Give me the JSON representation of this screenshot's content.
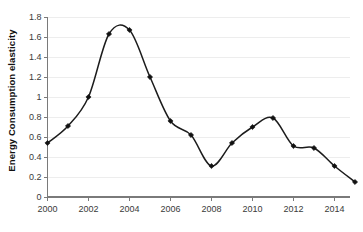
{
  "chart_data": {
    "type": "line",
    "title": "",
    "xlabel": "",
    "ylabel": "Energy Consumption elasticity",
    "x": [
      2000,
      2001,
      2002,
      2003,
      2004,
      2005,
      2006,
      2007,
      2008,
      2009,
      2010,
      2011,
      2012,
      2013,
      2014,
      2015
    ],
    "values": [
      0.54,
      0.71,
      1.0,
      1.63,
      1.67,
      1.2,
      0.76,
      0.62,
      0.31,
      0.54,
      0.7,
      0.79,
      0.51,
      0.49,
      0.31,
      0.15
    ],
    "series": [
      {
        "name": "Energy Consumption elasticity",
        "values": [
          0.54,
          0.71,
          1.0,
          1.63,
          1.67,
          1.2,
          0.76,
          0.62,
          0.31,
          0.54,
          0.7,
          0.79,
          0.51,
          0.49,
          0.31,
          0.15
        ]
      }
    ],
    "xlim": [
      2000,
      2015
    ],
    "ylim": [
      0,
      1.8
    ],
    "ytick_labels": [
      "0",
      "0.2",
      "0.4",
      "0.6",
      "0.8",
      "1",
      "1.2",
      "1.4",
      "1.6",
      "1.8"
    ],
    "ytick_values": [
      0,
      0.2,
      0.4,
      0.6,
      0.8,
      1.0,
      1.2,
      1.4,
      1.6,
      1.8
    ],
    "xtick_labels": [
      "2000",
      "2002",
      "2004",
      "2006",
      "2008",
      "2010",
      "2012",
      "2014"
    ],
    "xtick_values": [
      2000,
      2002,
      2004,
      2006,
      2008,
      2010,
      2012,
      2014
    ],
    "grid": "horizontal",
    "legend": "none",
    "marker": "diamond",
    "line_color": "#1c1c1c",
    "grid_color": "#ededed",
    "axis_color": "#7a7a7a",
    "smoothing": "spline"
  }
}
